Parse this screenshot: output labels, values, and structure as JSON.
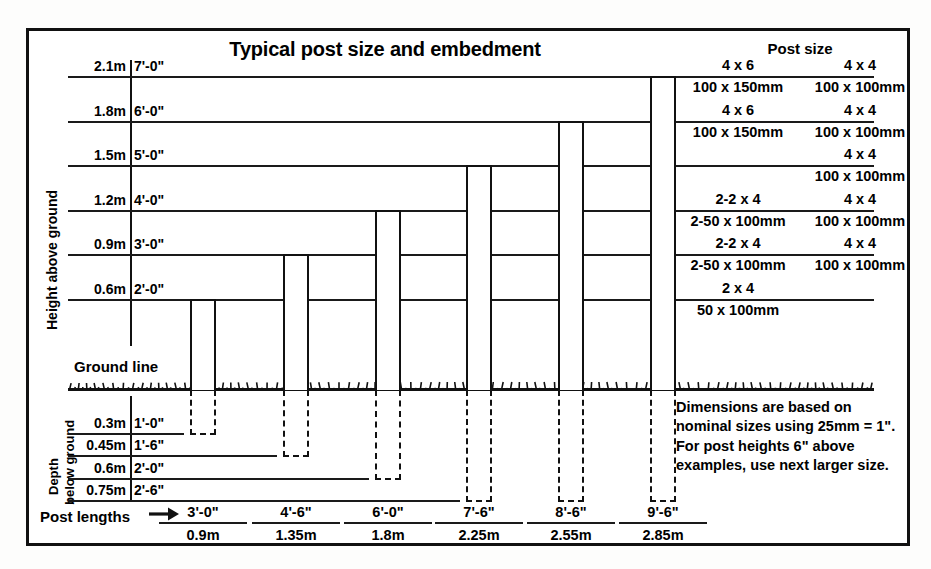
{
  "title": "Typical post size and embedment",
  "post_size_header": "Post size",
  "axis": {
    "height_caption": "Height above ground",
    "depth_caption_line1": "Depth",
    "depth_caption_line2": "below ground",
    "ground_line_label": "Ground line",
    "post_lengths_label": "Post lengths",
    "arrow_icon": "right-arrow-icon"
  },
  "height_scale": [
    {
      "metric": "2.1m",
      "imperial": "7'-0\""
    },
    {
      "metric": "1.8m",
      "imperial": "6'-0\""
    },
    {
      "metric": "1.5m",
      "imperial": "5'-0\""
    },
    {
      "metric": "1.2m",
      "imperial": "4'-0\""
    },
    {
      "metric": "0.9m",
      "imperial": "3'-0\""
    },
    {
      "metric": "0.6m",
      "imperial": "2'-0\""
    }
  ],
  "depth_scale": [
    {
      "metric": "0.3m",
      "imperial": "1'-0\""
    },
    {
      "metric": "0.45m",
      "imperial": "1'-6\""
    },
    {
      "metric": "0.6m",
      "imperial": "2'-0\""
    },
    {
      "metric": "0.75m",
      "imperial": "2'-6\""
    }
  ],
  "post_size_table": {
    "columns": [
      "4 x 6",
      "4 x 4"
    ],
    "rows": [
      {
        "imperial_a": "4 x 6",
        "imperial_b": "4 x 4",
        "metric_a": "100 x 150mm",
        "metric_b": "100 x 100mm"
      },
      {
        "imperial_a": "4 x 6",
        "imperial_b": "4 x 4",
        "metric_a": "100 x 150mm",
        "metric_b": "100 x 100mm"
      },
      {
        "imperial_a": "",
        "imperial_b": "4 x 4",
        "metric_a": "",
        "metric_b": "100 x 100mm"
      },
      {
        "imperial_a": "2-2 x 4",
        "imperial_b": "4 x 4",
        "metric_a": "2-50 x 100mm",
        "metric_b": "100 x 100mm"
      },
      {
        "imperial_a": "2-2 x 4",
        "imperial_b": "4 x 4",
        "metric_a": "2-50 x 100mm",
        "metric_b": "100 x 100mm"
      },
      {
        "imperial_a": "2 x 4",
        "imperial_b": "",
        "metric_a": "50 x 100mm",
        "metric_b": ""
      }
    ]
  },
  "note": "Dimensions are based on nominal sizes using 25mm = 1\". For post heights 6\" above examples, use next larger size.",
  "post_lengths": [
    {
      "imperial": "3'-0\"",
      "metric": "0.9m"
    },
    {
      "imperial": "4'-6\"",
      "metric": "1.35m"
    },
    {
      "imperial": "6'-0\"",
      "metric": "1.8m"
    },
    {
      "imperial": "7'-6\"",
      "metric": "2.25m"
    },
    {
      "imperial": "8'-6\"",
      "metric": "2.55m"
    },
    {
      "imperial": "9'-6\"",
      "metric": "2.85m"
    }
  ],
  "chart_data": {
    "type": "bar",
    "title": "Typical post size and embedment",
    "xlabel": "Post lengths",
    "ylabel": "Height above ground / Depth below ground",
    "units": "metres",
    "categories": [
      "3'-0\"",
      "4'-6\"",
      "6'-0\"",
      "7'-6\"",
      "8'-6\"",
      "9'-6\""
    ],
    "series": [
      {
        "name": "Height above ground (m)",
        "values": [
          0.6,
          0.9,
          1.2,
          1.5,
          1.8,
          2.1
        ]
      },
      {
        "name": "Depth below ground (m)",
        "values": [
          0.3,
          0.45,
          0.6,
          0.75,
          0.75,
          0.75
        ]
      }
    ],
    "total_post_length_m": [
      0.9,
      1.35,
      1.8,
      2.25,
      2.55,
      2.85
    ],
    "total_post_length_imperial": [
      "3'-0\"",
      "4'-6\"",
      "6'-0\"",
      "7'-6\"",
      "8'-6\"",
      "9'-6\""
    ],
    "y_above_ticks_m": [
      0.6,
      0.9,
      1.2,
      1.5,
      1.8,
      2.1
    ],
    "y_above_ticks_imperial": [
      "2'-0\"",
      "3'-0\"",
      "4'-0\"",
      "5'-0\"",
      "6'-0\"",
      "7'-0\""
    ],
    "y_below_ticks_m": [
      0.3,
      0.45,
      0.6,
      0.75
    ],
    "y_below_ticks_imperial": [
      "1'-0\"",
      "1'-6\"",
      "2'-0\"",
      "2'-6\""
    ],
    "grid": true,
    "legend": "none"
  }
}
